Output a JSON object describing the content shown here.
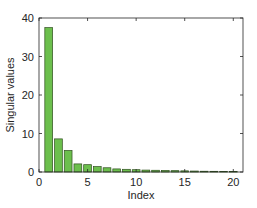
{
  "chart_data": {
    "type": "bar",
    "title": "",
    "xlabel": "Index",
    "ylabel": "Singular values",
    "x": [
      1,
      2,
      3,
      4,
      5,
      6,
      7,
      8,
      9,
      10,
      11,
      12,
      13,
      14,
      15,
      16,
      17,
      18,
      19,
      20
    ],
    "values": [
      37.5,
      8.6,
      5.6,
      2.1,
      1.9,
      1.4,
      1.1,
      0.8,
      0.7,
      0.6,
      0.5,
      0.45,
      0.4,
      0.35,
      0.3,
      0.25,
      0.2,
      0.18,
      0.15,
      0.12
    ],
    "xlim": [
      0,
      21
    ],
    "ylim": [
      0,
      40
    ],
    "xticks": [
      0,
      5,
      10,
      15,
      20
    ],
    "yticks": [
      0,
      10,
      20,
      30,
      40
    ],
    "grid": false,
    "legend": null,
    "colors": {
      "bar_fill": "#6cbf4d",
      "bar_edge": "#2f4f1f",
      "axis": "#262626"
    }
  }
}
